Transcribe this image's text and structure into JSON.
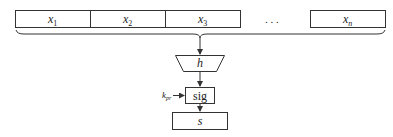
{
  "diagram": {
    "inputs": [
      {
        "label": "x",
        "sub": "1"
      },
      {
        "label": "x",
        "sub": "2"
      },
      {
        "label": "x",
        "sub": "3"
      },
      {
        "label": "x",
        "sub": "n"
      }
    ],
    "ellipsis": ". . .",
    "hash_label": "h",
    "sig_label": "sig",
    "key_label": "k",
    "key_sub": "pr",
    "output_label": "s",
    "colors": {
      "stroke": "#333333",
      "text": "#222222",
      "background": "#ffffff"
    }
  }
}
